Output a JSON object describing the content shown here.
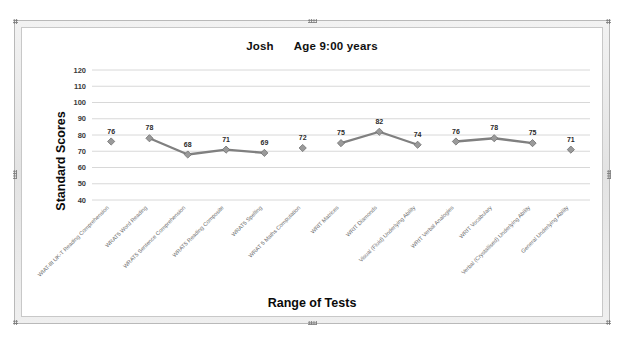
{
  "frame": {
    "name": "embedded-chart-object",
    "handles": [
      "top-left",
      "top-center",
      "top-right",
      "middle-left",
      "middle-right",
      "bottom-left",
      "bottom-center",
      "bottom-right"
    ]
  },
  "chart_data": {
    "type": "line",
    "title": "Josh      Age 9:00 years",
    "subject_name": "Josh",
    "age_text": "Age 9:00 years",
    "xlabel": "Range of Tests",
    "ylabel": "Standard Scores",
    "ylim": [
      40,
      120
    ],
    "ytick_step": 10,
    "yticks": [
      120,
      110,
      100,
      90,
      80,
      70,
      60,
      50,
      40
    ],
    "grid": true,
    "legend": "none",
    "data_labels": true,
    "marker": "diamond",
    "line_color": "#808080",
    "marker_color": "#9a9a9a",
    "grid_color": "#d4d4d4",
    "categories": [
      "WIAT-III UK-T Reading Comprehension",
      "WRAT5 Word Reading",
      "WRAT5 Sentence Comprehension",
      "WRAT5 Reading Composite",
      "WRAT5 Spelling",
      "WRAT 5 Maths Computation",
      "WRIT Matrices",
      "WRIT Diamonds",
      "Visual (Fluid) Underlying Ability",
      "WRIT Verbal Analogies",
      "WRIT Vocabulary",
      "Verbal (Crystallised) Underlying Ability",
      "General Underlying Ability"
    ],
    "values": [
      76,
      78,
      68,
      71,
      69,
      72,
      75,
      82,
      74,
      76,
      78,
      75,
      71
    ],
    "segments": [
      [
        0
      ],
      [
        1,
        2,
        3,
        4
      ],
      [
        5
      ],
      [
        6,
        7,
        8
      ],
      [
        9,
        10,
        11
      ],
      [
        12
      ]
    ]
  }
}
